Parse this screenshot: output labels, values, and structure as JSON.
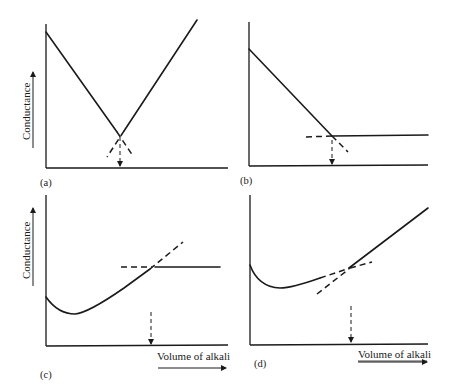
{
  "figure": {
    "ylabel": "Conductance",
    "xlabel": "Volume of alkali",
    "panels": [
      {
        "id": "a",
        "label": "(a)",
        "description": "Strong acid vs strong base: two straight lines forming a V; end point at intersection"
      },
      {
        "id": "b",
        "label": "(b)",
        "description": "Strong acid vs weak base: decreasing line then flat horizontal line; end point at intersection"
      },
      {
        "id": "c",
        "label": "(c)",
        "description": "Weak acid vs strong base: initial dip then rising line, then flat horizontal line"
      },
      {
        "id": "d",
        "label": "(d)",
        "description": "Weak acid vs strong base: initial dip, gentle rise, then steeper rise; end point at intersection"
      }
    ]
  },
  "colors": {
    "ink": "#1a1a1a",
    "background": "#ffffff"
  }
}
